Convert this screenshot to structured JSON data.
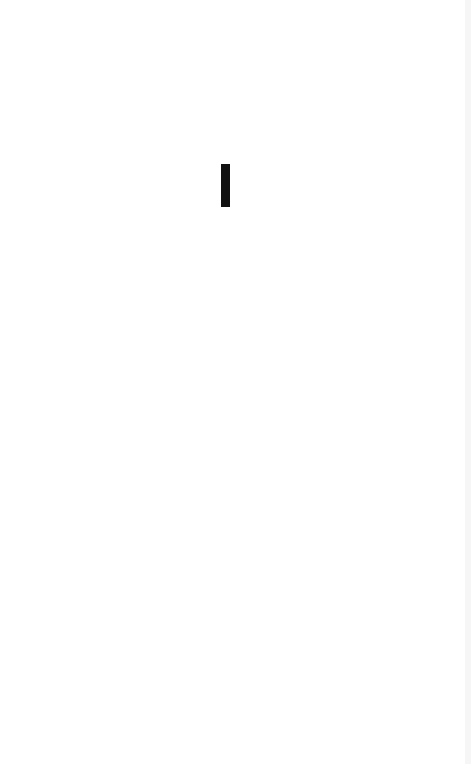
{
  "page": {
    "background_color": "#ffffff",
    "content_text": ""
  },
  "cursor": {
    "type": "text-caret",
    "color": "#111111"
  }
}
